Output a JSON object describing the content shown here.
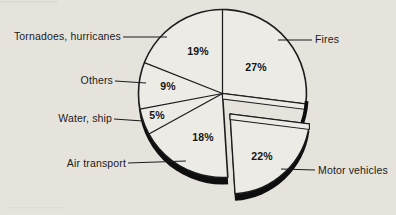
{
  "figure": {
    "background_color": "#e6e3dd",
    "pie_fill_color": "#edebe6",
    "line_color": "#1c1c1c",
    "shadow_color": "#0e0e0e"
  },
  "chart_data": {
    "type": "pie",
    "title": "",
    "units": "%",
    "order": "clockwise from 12 o'clock",
    "legend_position": "callout labels with leader lines",
    "slices": [
      {
        "label": "Fires",
        "value": 27,
        "value_label": "27%",
        "exploded": false
      },
      {
        "label": "Motor vehicles",
        "value": 22,
        "value_label": "22%",
        "exploded": true
      },
      {
        "label": "Air transport",
        "value": 18,
        "value_label": "18%",
        "exploded": false
      },
      {
        "label": "Water, ship",
        "value": 5,
        "value_label": "5%",
        "exploded": false
      },
      {
        "label": "Others",
        "value": 9,
        "value_label": "9%",
        "exploded": false
      },
      {
        "label": "Tornadoes, hurricanes",
        "value": 19,
        "value_label": "19%",
        "exploded": false
      }
    ]
  }
}
